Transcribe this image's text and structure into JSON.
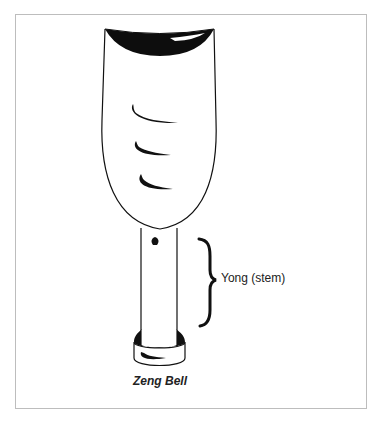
{
  "diagram": {
    "caption": "Zeng Bell",
    "labels": {
      "yong": "Yong (stem)"
    },
    "parts": [
      "bell body",
      "mouth (rim)",
      "decorative marks",
      "yong (stem)",
      "base ring"
    ],
    "colors": {
      "stroke": "#111111",
      "fill_dark": "#0d0d0d",
      "frame": "#bdbdbd",
      "background": "#ffffff"
    }
  }
}
